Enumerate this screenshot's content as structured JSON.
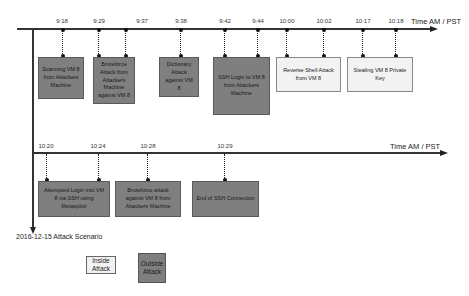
{
  "diagram": {
    "caption": "2016-12-15 Attack Scenario",
    "axis_title": "Time  AM / PST",
    "colors": {
      "outside_attack": "#7f7f7f",
      "inside_attack": "#f2f2f2",
      "line": "#333333"
    },
    "row1": {
      "ticks": [
        {
          "time": "9:18",
          "x": 62
        },
        {
          "time": "9:29",
          "x": 99
        },
        {
          "time": "9:37",
          "x": 126
        },
        {
          "time": "9:38",
          "x": 181
        },
        {
          "time": "9:42",
          "x": 225
        },
        {
          "time": "9:44",
          "x": 258
        },
        {
          "time": "10:00",
          "x": 287
        },
        {
          "time": "10:02",
          "x": 324
        },
        {
          "time": "10:17",
          "x": 363
        },
        {
          "time": "10:18",
          "x": 396
        }
      ],
      "events": [
        {
          "label": "Scanning VM 8 from Attackers Machine",
          "type": "outside"
        },
        {
          "label": "Bruteforce Attack from Attackers Machine against VM 8",
          "type": "outside"
        },
        {
          "label": "Dictionary Attack against VM 8",
          "type": "outside"
        },
        {
          "label": "SSH Login to VM 8 from Attackers Machine",
          "type": "outside"
        },
        {
          "label": "Reverse Shell Attack from VM 8",
          "type": "inside"
        },
        {
          "label": "Stealing VM 8 Private Key",
          "type": "inside"
        }
      ]
    },
    "row2": {
      "ticks": [
        {
          "time": "10:20",
          "x": 46
        },
        {
          "time": "10:24",
          "x": 99
        },
        {
          "time": "10:28",
          "x": 148
        },
        {
          "time": "10:29",
          "x": 225
        }
      ],
      "events": [
        {
          "label": "Attempted Login into VM 8 via SSH using Metasploit",
          "type": "outside"
        },
        {
          "label": "Bruteforce attack against VM 8 from Attackers Machine",
          "type": "outside"
        },
        {
          "label": "End of SSH Connection",
          "type": "outside"
        }
      ]
    },
    "legend": {
      "inside": "Inside Attack",
      "outside": "Outside Attack"
    }
  }
}
